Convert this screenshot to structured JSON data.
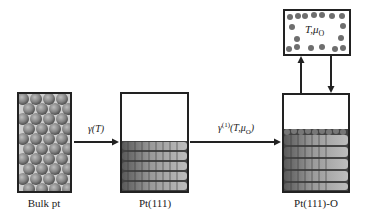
{
  "diagram": {
    "stages": [
      {
        "id": "bulk",
        "label": "Bulk pt"
      },
      {
        "id": "surface",
        "label": "Pt(111)"
      },
      {
        "id": "oxide_surface",
        "label": "Pt(111)-O"
      }
    ],
    "transitions": [
      {
        "from": "bulk",
        "to": "surface",
        "label": "γ(T)"
      },
      {
        "from": "surface",
        "to": "oxide_surface",
        "label": "γ(1)(T,μO)",
        "label_parts": {
          "base": "γ",
          "sup": "(1)",
          "args": "(T,μ",
          "sub": "O",
          "close": ")"
        }
      }
    ],
    "reservoir": {
      "label_parts": {
        "t": "T,",
        "mu": "μ",
        "sub": "O"
      },
      "exchange": [
        "up-arrow",
        "down-arrow"
      ]
    }
  },
  "colors": {
    "line": "#222222",
    "atom": "#8a8a8a",
    "atom_dark": "#5a5a5a",
    "gas_atom": "#6e6e6e"
  }
}
